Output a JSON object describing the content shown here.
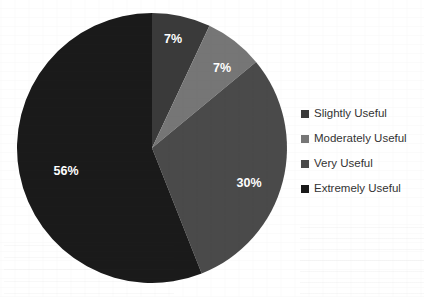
{
  "chart_data": {
    "type": "pie",
    "title": "",
    "categories": [
      "Slightly Useful",
      "Moderately Useful",
      "Very Useful",
      "Extremely Useful"
    ],
    "values": [
      7,
      7,
      30,
      56
    ],
    "value_labels": [
      "7%",
      "7%",
      "30%",
      "56%"
    ],
    "unit": "%",
    "colors": [
      "#3a3a3a",
      "#767676",
      "#4a4a4a",
      "#1a1a1a"
    ],
    "label_color": "#ffffff",
    "start_angle_deg": 0,
    "direction": "clockwise",
    "legend_position": "right",
    "grid": false,
    "background": "#ffffff",
    "slices": [
      {
        "label": "Slightly Useful",
        "value": 7,
        "value_label": "7%",
        "color": "#3a3a3a",
        "label_x": 173,
        "label_y": 40
      },
      {
        "label": "Moderately Useful",
        "value": 7,
        "value_label": "7%",
        "color": "#767676",
        "label_x": 222,
        "label_y": 69
      },
      {
        "label": "Very Useful",
        "value": 30,
        "value_label": "30%",
        "color": "#4a4a4a",
        "label_x": 249,
        "label_y": 184
      },
      {
        "label": "Extremely Useful",
        "value": 56,
        "value_label": "56%",
        "color": "#1a1a1a",
        "label_x": 66,
        "label_y": 172
      }
    ]
  },
  "legend": {
    "items": [
      {
        "label": "Slightly Useful",
        "color": "#3a3a3a"
      },
      {
        "label": "Moderately Useful",
        "color": "#767676"
      },
      {
        "label": "Very Useful",
        "color": "#4a4a4a"
      },
      {
        "label": "Extremely Useful",
        "color": "#1a1a1a"
      }
    ]
  },
  "geometry": {
    "center_x": 152,
    "center_y": 148,
    "radius": 135
  }
}
